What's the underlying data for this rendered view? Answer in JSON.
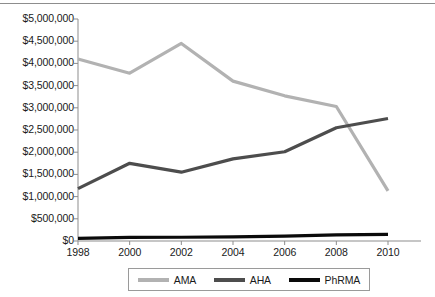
{
  "chart_data": {
    "type": "line",
    "title": "",
    "subtitle": "",
    "xlabel": "",
    "ylabel": "",
    "x": [
      1998,
      2000,
      2002,
      2004,
      2006,
      2008,
      2010
    ],
    "categories": [
      "1998",
      "2000",
      "2002",
      "2004",
      "2006",
      "2008",
      "2010"
    ],
    "xlim": [
      1998,
      2010
    ],
    "ylim": [
      0,
      5000000
    ],
    "ytick_values": [
      0,
      500000,
      1000000,
      1500000,
      2000000,
      2500000,
      3000000,
      3500000,
      4000000,
      4500000,
      5000000
    ],
    "ytick_labels": [
      "$0",
      "$500,000",
      "$1,000,000",
      "$1,500,000",
      "$2,000,000",
      "$2,500,000",
      "$3,000,000",
      "$3,500,000",
      "$4,000,000",
      "$4,500,000",
      "$5,000,000"
    ],
    "grid": false,
    "legend_position": "bottom",
    "series": [
      {
        "name": "AMA",
        "color": "#b2b2b2",
        "values": [
          4100000,
          3780000,
          4450000,
          3600000,
          3270000,
          3030000,
          1130000
        ]
      },
      {
        "name": "AHA",
        "color": "#4d4d4d",
        "values": [
          1180000,
          1750000,
          1550000,
          1850000,
          2010000,
          2550000,
          2760000
        ]
      },
      {
        "name": "PhRMA",
        "color": "#0a0a0a",
        "values": [
          60000,
          80000,
          85000,
          95000,
          110000,
          140000,
          150000
        ]
      }
    ]
  },
  "axis": {
    "axis_color": "#8d8d8d",
    "tick_color": "#8d8d8d",
    "text_color": "#1a1a1a"
  },
  "legend": {
    "entries": [
      {
        "label": "AMA",
        "color": "#b2b2b2"
      },
      {
        "label": "AHA",
        "color": "#4d4d4d"
      },
      {
        "label": "PhRMA",
        "color": "#0a0a0a"
      }
    ]
  }
}
